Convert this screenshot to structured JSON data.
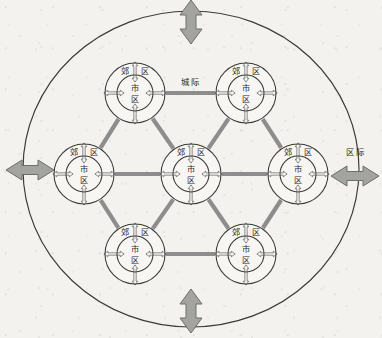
{
  "figure": {
    "title": "",
    "background_color": "#f3f2ef",
    "line_color": "#3a3a3a",
    "connector_color": "#8d8d8d",
    "arrow_fill": "#a0a09c",
    "arrow_stroke": "#6b6b68",
    "node_fill": "#f7f6f3",
    "text_color": "#2b2b2b"
  },
  "outer_boundary": {
    "name": "region-boundary-ellipse",
    "cx": 191,
    "cy": 169,
    "rx": 168,
    "ry": 158
  },
  "external_arrows": [
    {
      "id": "arrow-top",
      "label": "",
      "orientation": "vertical",
      "cx": 191,
      "cy": 22
    },
    {
      "id": "arrow-bottom",
      "label": "",
      "orientation": "vertical",
      "cx": 191,
      "cy": 311
    },
    {
      "id": "arrow-left",
      "label": "",
      "orientation": "horizontal",
      "cx": 30,
      "cy": 170
    },
    {
      "id": "arrow-right",
      "label": "区际",
      "orientation": "horizontal",
      "cx": 355,
      "cy": 176
    }
  ],
  "edge_labels": [
    {
      "id": "label-intercity",
      "text": "城际",
      "x": 191,
      "y": 82
    },
    {
      "id": "label-interregional",
      "text": "区际",
      "x": 356,
      "y": 152
    }
  ],
  "nodes": [
    {
      "id": "node-center",
      "name": "city-node-center",
      "cx": 191,
      "cy": 174,
      "outer_r": 30,
      "inner_r": 18,
      "suburb_label": "郊区",
      "urban_label": "市区"
    },
    {
      "id": "node-top-left",
      "name": "city-node-top-left",
      "cx": 135,
      "cy": 93,
      "outer_r": 30,
      "inner_r": 18,
      "suburb_label": "郊区",
      "urban_label": "市区"
    },
    {
      "id": "node-top-right",
      "name": "city-node-top-right",
      "cx": 246,
      "cy": 93,
      "outer_r": 30,
      "inner_r": 18,
      "suburb_label": "郊区",
      "urban_label": "市区"
    },
    {
      "id": "node-left",
      "name": "city-node-left",
      "cx": 84,
      "cy": 174,
      "outer_r": 30,
      "inner_r": 18,
      "suburb_label": "郊区",
      "urban_label": "市区"
    },
    {
      "id": "node-right",
      "name": "city-node-right",
      "cx": 298,
      "cy": 174,
      "outer_r": 30,
      "inner_r": 18,
      "suburb_label": "郊区",
      "urban_label": "市区"
    },
    {
      "id": "node-bottom-left",
      "name": "city-node-bottom-left",
      "cx": 135,
      "cy": 254,
      "outer_r": 30,
      "inner_r": 18,
      "suburb_label": "郊区",
      "urban_label": "市区"
    },
    {
      "id": "node-bottom-right",
      "name": "city-node-bottom-right",
      "cx": 246,
      "cy": 254,
      "outer_r": 30,
      "inner_r": 18,
      "suburb_label": "郊区",
      "urban_label": "市区"
    }
  ],
  "connectors": [
    {
      "id": "edge-center-topleft",
      "from": "node-center",
      "to": "node-top-left"
    },
    {
      "id": "edge-center-topright",
      "from": "node-center",
      "to": "node-top-right"
    },
    {
      "id": "edge-center-left",
      "from": "node-center",
      "to": "node-left"
    },
    {
      "id": "edge-center-right",
      "from": "node-center",
      "to": "node-right"
    },
    {
      "id": "edge-center-bottomleft",
      "from": "node-center",
      "to": "node-bottom-left"
    },
    {
      "id": "edge-center-bottomright",
      "from": "node-center",
      "to": "node-bottom-right"
    },
    {
      "id": "edge-topleft-topright",
      "from": "node-top-left",
      "to": "node-top-right"
    },
    {
      "id": "edge-topleft-left",
      "from": "node-top-left",
      "to": "node-left"
    },
    {
      "id": "edge-topright-right",
      "from": "node-top-right",
      "to": "node-right"
    },
    {
      "id": "edge-left-bottomleft",
      "from": "node-left",
      "to": "node-bottom-left"
    },
    {
      "id": "edge-right-bottomright",
      "from": "node-right",
      "to": "node-bottom-right"
    },
    {
      "id": "edge-bottomleft-bottomright",
      "from": "node-bottom-left",
      "to": "node-bottom-right"
    }
  ]
}
